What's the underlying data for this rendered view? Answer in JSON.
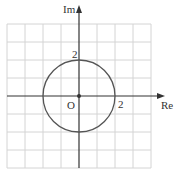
{
  "diagram": {
    "type": "argand-diagram",
    "axes": {
      "x_label": "Re",
      "y_label": "Im",
      "origin_label": "O"
    },
    "tick_labels": {
      "x": "2",
      "y": "2"
    },
    "circle": {
      "center": [
        0,
        0
      ],
      "radius": 2
    },
    "grid": {
      "range_x": [
        -4,
        4
      ],
      "range_y": [
        -4,
        4
      ],
      "step": 1
    },
    "colors": {
      "grid": "#d4d4d4",
      "axis": "#333333",
      "circle": "#555555"
    }
  }
}
